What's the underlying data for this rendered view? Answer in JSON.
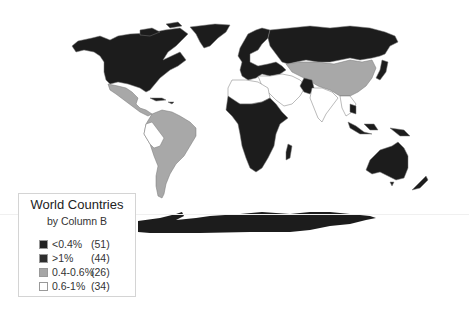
{
  "legend": {
    "title": "World Countries",
    "subtitle": "by Column B",
    "items": [
      {
        "label": "<0.4%",
        "count": "(51)",
        "color": "#222222"
      },
      {
        "label": ">1%",
        "count": "(44)",
        "color": "#2e2e2e"
      },
      {
        "label": "0.4-0.6%",
        "count": "(26)",
        "color": "#a6a6a6"
      },
      {
        "label": "0.6-1%",
        "count": "(34)",
        "color": "#ffffff"
      }
    ]
  },
  "colors": {
    "dark": "#1c1c1c",
    "gray": "#a8a8a8",
    "white": "#ffffff",
    "border": "#888888"
  }
}
